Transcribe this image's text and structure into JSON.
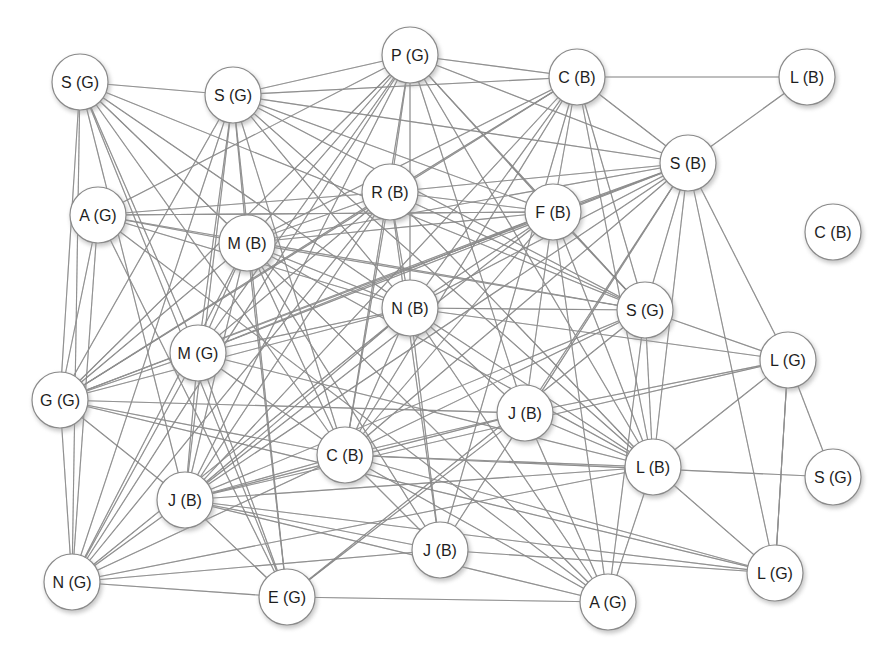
{
  "diagram": {
    "type": "network-graph",
    "node_radius": 28,
    "edge_color": "#6a6a6a",
    "node_fill": "#ffffff",
    "node_stroke": "#8a8a8a",
    "label_color": "#1e1e1e"
  },
  "nodes": [
    {
      "id": 0,
      "label": "S (G)",
      "x": 80,
      "y": 82
    },
    {
      "id": 1,
      "label": "S (G)",
      "x": 233,
      "y": 95
    },
    {
      "id": 2,
      "label": "P (G)",
      "x": 410,
      "y": 55
    },
    {
      "id": 3,
      "label": "C (B)",
      "x": 577,
      "y": 77
    },
    {
      "id": 4,
      "label": "L (B)",
      "x": 807,
      "y": 77
    },
    {
      "id": 5,
      "label": "S (B)",
      "x": 688,
      "y": 163
    },
    {
      "id": 6,
      "label": "R (B)",
      "x": 390,
      "y": 192
    },
    {
      "id": 7,
      "label": "F (B)",
      "x": 553,
      "y": 212
    },
    {
      "id": 8,
      "label": "C (B)",
      "x": 833,
      "y": 232
    },
    {
      "id": 9,
      "label": "A (G)",
      "x": 98,
      "y": 215
    },
    {
      "id": 10,
      "label": "M (B)",
      "x": 247,
      "y": 243
    },
    {
      "id": 11,
      "label": "N (B)",
      "x": 410,
      "y": 308
    },
    {
      "id": 12,
      "label": "S (G)",
      "x": 645,
      "y": 310
    },
    {
      "id": 13,
      "label": "M (G)",
      "x": 198,
      "y": 353
    },
    {
      "id": 14,
      "label": "L (G)",
      "x": 788,
      "y": 360
    },
    {
      "id": 15,
      "label": "G (G)",
      "x": 60,
      "y": 400
    },
    {
      "id": 16,
      "label": "J (B)",
      "x": 525,
      "y": 413
    },
    {
      "id": 17,
      "label": "C (B)",
      "x": 345,
      "y": 455
    },
    {
      "id": 18,
      "label": "L (B)",
      "x": 653,
      "y": 467
    },
    {
      "id": 19,
      "label": "S (G)",
      "x": 833,
      "y": 477
    },
    {
      "id": 20,
      "label": "J (B)",
      "x": 185,
      "y": 500
    },
    {
      "id": 21,
      "label": "J (B)",
      "x": 440,
      "y": 550
    },
    {
      "id": 22,
      "label": "N (G)",
      "x": 72,
      "y": 582
    },
    {
      "id": 23,
      "label": "E (G)",
      "x": 287,
      "y": 597
    },
    {
      "id": 24,
      "label": "L (G)",
      "x": 775,
      "y": 573
    },
    {
      "id": 25,
      "label": "A (G)",
      "x": 608,
      "y": 602
    }
  ],
  "edges": [
    [
      0,
      1
    ],
    [
      0,
      11
    ],
    [
      0,
      12
    ],
    [
      0,
      10
    ],
    [
      0,
      13
    ],
    [
      0,
      15
    ],
    [
      0,
      22
    ],
    [
      0,
      23
    ],
    [
      0,
      20
    ],
    [
      0,
      17
    ],
    [
      1,
      2
    ],
    [
      1,
      3
    ],
    [
      1,
      5
    ],
    [
      1,
      7
    ],
    [
      1,
      10
    ],
    [
      1,
      11
    ],
    [
      1,
      13
    ],
    [
      1,
      15
    ],
    [
      1,
      20
    ],
    [
      1,
      22
    ],
    [
      1,
      23
    ],
    [
      1,
      17
    ],
    [
      1,
      18
    ],
    [
      1,
      12
    ],
    [
      2,
      3
    ],
    [
      2,
      5
    ],
    [
      2,
      6
    ],
    [
      2,
      7
    ],
    [
      2,
      10
    ],
    [
      2,
      11
    ],
    [
      2,
      13
    ],
    [
      2,
      15
    ],
    [
      2,
      20
    ],
    [
      2,
      12
    ],
    [
      2,
      18
    ],
    [
      2,
      16
    ],
    [
      2,
      9
    ],
    [
      2,
      17
    ],
    [
      2,
      22
    ],
    [
      3,
      4
    ],
    [
      3,
      5
    ],
    [
      3,
      6
    ],
    [
      3,
      7
    ],
    [
      3,
      10
    ],
    [
      3,
      11
    ],
    [
      3,
      12
    ],
    [
      3,
      17
    ],
    [
      3,
      18
    ],
    [
      3,
      20
    ],
    [
      3,
      15
    ],
    [
      3,
      21
    ],
    [
      4,
      5
    ],
    [
      5,
      6
    ],
    [
      5,
      7
    ],
    [
      5,
      10
    ],
    [
      5,
      11
    ],
    [
      5,
      12
    ],
    [
      5,
      14
    ],
    [
      5,
      16
    ],
    [
      5,
      17
    ],
    [
      5,
      18
    ],
    [
      5,
      20
    ],
    [
      5,
      24
    ],
    [
      5,
      15
    ],
    [
      5,
      21
    ],
    [
      5,
      13
    ],
    [
      6,
      7
    ],
    [
      6,
      9
    ],
    [
      6,
      10
    ],
    [
      6,
      11
    ],
    [
      6,
      12
    ],
    [
      6,
      15
    ],
    [
      6,
      17
    ],
    [
      6,
      18
    ],
    [
      6,
      20
    ],
    [
      6,
      21
    ],
    [
      6,
      22
    ],
    [
      6,
      13
    ],
    [
      7,
      9
    ],
    [
      7,
      10
    ],
    [
      7,
      11
    ],
    [
      7,
      12
    ],
    [
      7,
      15
    ],
    [
      7,
      16
    ],
    [
      7,
      17
    ],
    [
      7,
      18
    ],
    [
      7,
      20
    ],
    [
      7,
      13
    ],
    [
      7,
      25
    ],
    [
      9,
      10
    ],
    [
      9,
      11
    ],
    [
      9,
      12
    ],
    [
      9,
      15
    ],
    [
      9,
      22
    ],
    [
      9,
      23
    ],
    [
      9,
      25
    ],
    [
      9,
      7
    ],
    [
      10,
      11
    ],
    [
      10,
      12
    ],
    [
      10,
      13
    ],
    [
      10,
      15
    ],
    [
      10,
      17
    ],
    [
      10,
      18
    ],
    [
      10,
      20
    ],
    [
      10,
      22
    ],
    [
      10,
      23
    ],
    [
      10,
      25
    ],
    [
      10,
      21
    ],
    [
      11,
      12
    ],
    [
      11,
      13
    ],
    [
      11,
      15
    ],
    [
      11,
      16
    ],
    [
      11,
      17
    ],
    [
      11,
      18
    ],
    [
      11,
      20
    ],
    [
      11,
      21
    ],
    [
      11,
      22
    ],
    [
      11,
      25
    ],
    [
      11,
      14
    ],
    [
      12,
      14
    ],
    [
      12,
      17
    ],
    [
      12,
      18
    ],
    [
      12,
      20
    ],
    [
      12,
      25
    ],
    [
      13,
      15
    ],
    [
      13,
      17
    ],
    [
      13,
      20
    ],
    [
      13,
      22
    ],
    [
      13,
      23
    ],
    [
      13,
      18
    ],
    [
      14,
      16
    ],
    [
      14,
      18
    ],
    [
      14,
      19
    ],
    [
      14,
      20
    ],
    [
      14,
      24
    ],
    [
      15,
      17
    ],
    [
      15,
      20
    ],
    [
      15,
      22
    ],
    [
      15,
      24
    ],
    [
      15,
      16
    ],
    [
      16,
      17
    ],
    [
      16,
      18
    ],
    [
      16,
      20
    ],
    [
      16,
      25
    ],
    [
      16,
      23
    ],
    [
      17,
      18
    ],
    [
      17,
      20
    ],
    [
      17,
      21
    ],
    [
      17,
      24
    ],
    [
      17,
      25
    ],
    [
      17,
      22
    ],
    [
      18,
      20
    ],
    [
      18,
      24
    ],
    [
      18,
      25
    ],
    [
      18,
      22
    ],
    [
      19,
      17
    ],
    [
      20,
      22
    ],
    [
      20,
      23
    ],
    [
      20,
      24
    ],
    [
      20,
      25
    ],
    [
      20,
      21
    ],
    [
      21,
      22
    ],
    [
      22,
      23
    ],
    [
      23,
      25
    ],
    [
      23,
      12
    ],
    [
      24,
      21
    ],
    [
      24,
      14
    ],
    [
      8,
      8
    ]
  ]
}
